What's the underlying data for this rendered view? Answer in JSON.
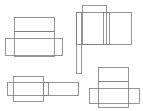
{
  "diagram": {
    "stroke_color": "#7a7a7a",
    "background": "#ffffff",
    "figures": [
      {
        "id": "net-top-left",
        "rects": [
          {
            "x": 14,
            "y": 17,
            "w": 40,
            "h": 14
          },
          {
            "x": 14,
            "y": 31,
            "w": 40,
            "h": 25
          },
          {
            "x": 5,
            "y": 38,
            "w": 57,
            "h": 17
          }
        ]
      },
      {
        "id": "net-top-right",
        "rects": [
          {
            "x": 82,
            "y": 5,
            "w": 24,
            "h": 39
          },
          {
            "x": 76,
            "y": 12,
            "w": 55,
            "h": 32
          },
          {
            "x": 76,
            "y": 12,
            "w": 5,
            "h": 61
          },
          {
            "x": 103,
            "y": 12,
            "w": 6,
            "h": 32
          }
        ]
      },
      {
        "id": "net-bottom-left",
        "rects": [
          {
            "x": 13,
            "y": 76,
            "w": 30,
            "h": 25
          },
          {
            "x": 7,
            "y": 82,
            "w": 71,
            "h": 13
          },
          {
            "x": 43,
            "y": 82,
            "w": 5,
            "h": 13
          }
        ]
      },
      {
        "id": "net-bottom-right",
        "rects": [
          {
            "x": 98,
            "y": 67,
            "w": 30,
            "h": 14
          },
          {
            "x": 98,
            "y": 81,
            "w": 30,
            "h": 26
          },
          {
            "x": 89,
            "y": 88,
            "w": 50,
            "h": 15
          }
        ]
      }
    ]
  }
}
